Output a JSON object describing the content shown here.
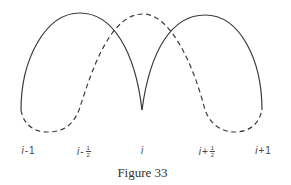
{
  "figure": {
    "caption": "Figure 33",
    "labels": [
      {
        "id": "i-minus-1",
        "var": "i",
        "op": "-",
        "value": "1",
        "fraction": null,
        "x": 28
      },
      {
        "id": "i-minus-half",
        "var": "i",
        "op": "-",
        "value": "",
        "fraction": {
          "num": "1",
          "den": "2"
        },
        "x": 84
      },
      {
        "id": "i",
        "var": "i",
        "op": "",
        "value": "",
        "fraction": null,
        "x": 142
      },
      {
        "id": "i-plus-half",
        "var": "i",
        "op": "+",
        "value": "",
        "fraction": {
          "num": "1",
          "den": "2"
        },
        "x": 207
      },
      {
        "id": "i-plus-1",
        "var": "i",
        "op": "+",
        "value": "1",
        "fraction": null,
        "x": 263
      }
    ],
    "curves": {
      "solid_left": "M21,110 C21,60 45,13 80,13 C112,13 135,50 142,110",
      "solid_right": "M142,110 C150,50 172,15 205,15 C240,15 262,60 262,110",
      "dashed": "M21,110 C24,128 38,132 47,132 C60,132 72,128 79,110 C92,70 110,14 143,14 C172,14 195,70 205,110 C212,128 225,132 235,132 C245,132 258,128 262,110"
    },
    "stroke_color": "#3a3a3a"
  }
}
